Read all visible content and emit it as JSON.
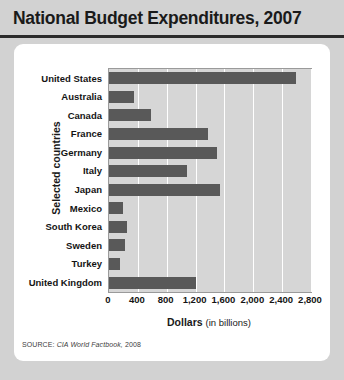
{
  "title": "National Budget Expenditures, 2007",
  "source": {
    "prefix": "SOURCE:",
    "publication": "CIA World Factbook,",
    "year": "2008"
  },
  "axes": {
    "y_title": "Selected countries",
    "x_title_bold": "Dollars",
    "x_title_light": "(in billions)"
  },
  "colors": {
    "bar": "#595959",
    "plot_background": "#d6d6d6",
    "gridline": "#ffffff",
    "card": "#ffffff",
    "page_background": "#d2d2d2",
    "title_rule": "#2b2b2b",
    "text": "#141414"
  },
  "chart_data": {
    "type": "bar",
    "orientation": "horizontal",
    "title": "National Budget Expenditures, 2007",
    "xlabel": "Dollars (in billions)",
    "ylabel": "Selected countries",
    "xlim": [
      0,
      2800
    ],
    "xticks": [
      0,
      400,
      800,
      1200,
      1600,
      2000,
      2400,
      2800
    ],
    "xtick_labels": [
      "0",
      "400",
      "800",
      "1,200",
      "1,600",
      "2,000",
      "2,400",
      "2,800"
    ],
    "grid": true,
    "legend": false,
    "categories": [
      "United States",
      "Australia",
      "Canada",
      "France",
      "Germany",
      "Italy",
      "Japan",
      "Mexico",
      "South Korea",
      "Sweden",
      "Turkey",
      "United Kingdom"
    ],
    "values": [
      2590,
      350,
      580,
      1375,
      1500,
      1080,
      1540,
      195,
      250,
      220,
      150,
      1200
    ],
    "units": "billions of dollars"
  }
}
